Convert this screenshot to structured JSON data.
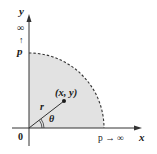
{
  "figure": {
    "type": "polar-coordinates-quarter-disk",
    "colors": {
      "background": "#ffffff",
      "region_fill": "#e2e2e2",
      "axis": "#333333",
      "boundary": "#333333"
    },
    "axes": {
      "x_label": "x",
      "y_label": "y",
      "origin_label": "0"
    },
    "labels": {
      "y_infinity": "∞",
      "y_arrow": "↑",
      "y_radius": "p",
      "x_radius_limit": "p → ∞",
      "point": "(x, y)",
      "radius": "r",
      "angle": "θ"
    },
    "region": {
      "shape": "quarter-disk",
      "boundary_style": "dashed",
      "radius_px": 75
    }
  }
}
